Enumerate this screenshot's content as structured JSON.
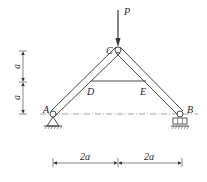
{
  "diagram": {
    "type": "truss structure",
    "labels": {
      "load": "P",
      "apex": "C",
      "left_support": "A",
      "right_support": "B",
      "tie_left": "D",
      "tie_right": "E"
    },
    "dimensions": {
      "vertical_upper": "a",
      "vertical_lower": "a",
      "horizontal_left": "2a",
      "horizontal_right": "2a"
    },
    "colors": {
      "line": "#333333",
      "background": "#ffffff"
    }
  }
}
